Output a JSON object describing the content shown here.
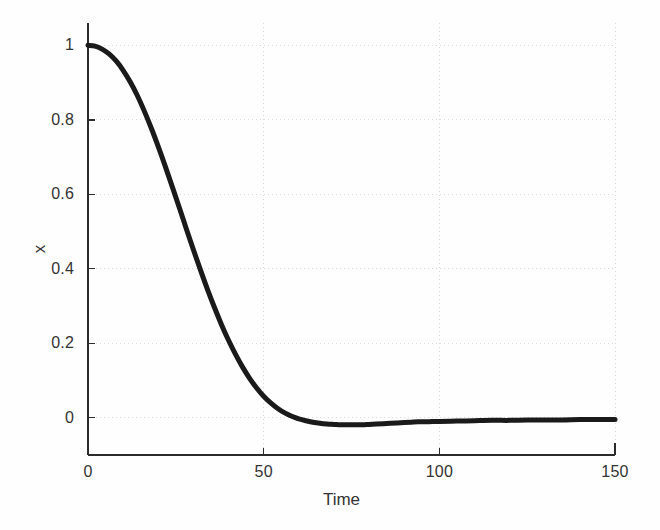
{
  "figure": {
    "background_color": "#fefefe",
    "axis_color": "#2b2b2b",
    "grid_color": "#d8d8d8",
    "curve_color": "#1a1a1a"
  },
  "axes": {
    "x": {
      "label": "Time",
      "ticks": [
        {
          "value": 0,
          "label": "0"
        },
        {
          "value": 50,
          "label": "50"
        },
        {
          "value": 100,
          "label": "100"
        },
        {
          "value": 150,
          "label": "150"
        }
      ],
      "range": [
        0,
        150
      ]
    },
    "y": {
      "label": "x",
      "ticks": [
        {
          "value": 0,
          "label": "0"
        },
        {
          "value": 0.2,
          "label": "0.2"
        },
        {
          "value": 0.4,
          "label": "0.4"
        },
        {
          "value": 0.6,
          "label": "0.6"
        },
        {
          "value": 0.8,
          "label": "0.8"
        },
        {
          "value": 1,
          "label": "1"
        }
      ],
      "range": [
        -0.1,
        1.06
      ]
    }
  },
  "chart_data": {
    "type": "line",
    "title": "",
    "xlabel": "Time",
    "ylabel": "x",
    "xlim": [
      0,
      150
    ],
    "ylim": [
      -0.1,
      1.06
    ],
    "grid": true,
    "legend": null,
    "series": [
      {
        "name": "x(t)",
        "color": "#1a1a1a",
        "line_width": 5,
        "x": [
          0,
          2,
          4,
          6,
          8,
          10,
          12,
          14,
          16,
          18,
          20,
          22,
          24,
          26,
          28,
          30,
          32,
          34,
          36,
          38,
          40,
          42,
          44,
          46,
          48,
          50,
          52,
          54,
          56,
          58,
          60,
          62,
          64,
          66,
          68,
          70,
          72,
          74,
          76,
          78,
          80,
          82,
          84,
          86,
          88,
          90,
          92,
          94,
          96,
          98,
          100,
          105,
          110,
          115,
          120,
          125,
          130,
          135,
          140,
          145,
          150
        ],
        "y": [
          1.0,
          0.998,
          0.99,
          0.977,
          0.958,
          0.933,
          0.902,
          0.866,
          0.824,
          0.778,
          0.728,
          0.675,
          0.62,
          0.564,
          0.507,
          0.451,
          0.397,
          0.345,
          0.296,
          0.25,
          0.208,
          0.17,
          0.136,
          0.106,
          0.08,
          0.058,
          0.04,
          0.025,
          0.013,
          0.004,
          -0.003,
          -0.008,
          -0.012,
          -0.015,
          -0.017,
          -0.018,
          -0.019,
          -0.019,
          -0.019,
          -0.019,
          -0.018,
          -0.017,
          -0.016,
          -0.015,
          -0.014,
          -0.013,
          -0.012,
          -0.011,
          -0.011,
          -0.01,
          -0.01,
          -0.009,
          -0.008,
          -0.007,
          -0.007,
          -0.006,
          -0.006,
          -0.006,
          -0.005,
          -0.005,
          -0.005
        ]
      }
    ],
    "annotations": []
  }
}
